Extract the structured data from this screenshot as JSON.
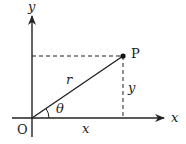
{
  "diagram": {
    "type": "polar-coordinates",
    "labels": {
      "y_axis": "y",
      "x_axis": "x",
      "origin": "O",
      "point": "P",
      "radius": "r",
      "angle": "θ",
      "x_component": "x",
      "y_component": "y"
    },
    "colors": {
      "line": "#222222",
      "background": "#ffffff"
    }
  }
}
